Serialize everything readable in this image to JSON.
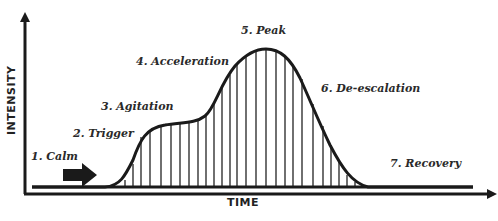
{
  "diagram": {
    "x_axis_label": "TIME",
    "y_axis_label": "INTENSITY",
    "phases": [
      {
        "label": "1. Calm",
        "x": 31,
        "y": 150
      },
      {
        "label": "2. Trigger",
        "x": 73,
        "y": 127
      },
      {
        "label": "3. Agitation",
        "x": 101,
        "y": 100
      },
      {
        "label": "4. Acceleration",
        "x": 136,
        "y": 55
      },
      {
        "label": "5. Peak",
        "x": 241,
        "y": 24
      },
      {
        "label": "6. De-escalation",
        "x": 321,
        "y": 82
      },
      {
        "label": "7. Recovery",
        "x": 390,
        "y": 157
      }
    ],
    "colors": {
      "line": "#1a1a1a",
      "text": "#2a2a2a",
      "background": "#ffffff"
    }
  }
}
